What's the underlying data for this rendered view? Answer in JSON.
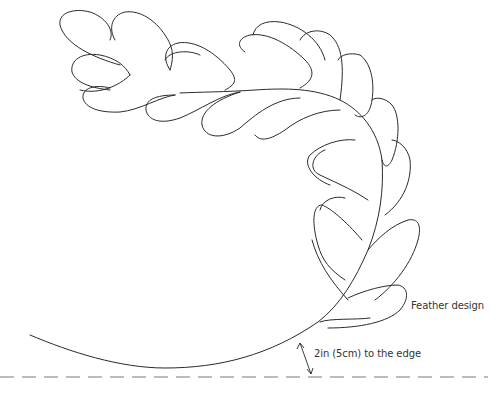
{
  "diagram": {
    "labels": {
      "feather": "Feather design",
      "margin": "2in (5cm) to the edge"
    },
    "colors": {
      "line": "#2a2a2a",
      "dash": "#7a7a7a",
      "text": "#333333",
      "background": "#ffffff"
    },
    "elements": {
      "feather_plumes": "double row of teardrop plumes along curved spine",
      "spine": "curved stem sweeping from top-left, down right side, to bottom-left",
      "edge_line": "dashed line marking quilt edge",
      "margin_arrow": "double-headed arrow between spine and dashed edge"
    }
  }
}
